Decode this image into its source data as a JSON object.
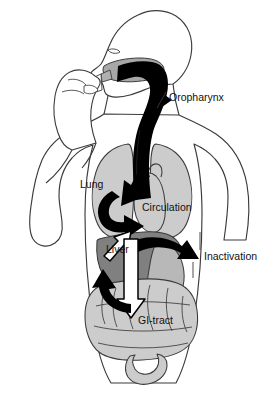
{
  "figure": {
    "background_color": "#ffffff"
  },
  "palette": {
    "outline": "#3b3b3b",
    "body_fill": "#ffffff",
    "organ_light_gray": "#cccccc",
    "organ_mid_gray": "#b8b8b8",
    "liver_gray": "#808080",
    "tongue_gray": "#a8a8a8",
    "airway_black": "#000000",
    "arrow_black": "#000000",
    "arrow_outline_white": "#ffffff",
    "label_text": "#111111"
  },
  "labels": [
    {
      "id": "oropharynx",
      "text": "Oropharynx",
      "x": 169,
      "y": 98,
      "anchor": "start",
      "leader": true
    },
    {
      "id": "lung",
      "text": "Lung",
      "x": 80,
      "y": 185,
      "anchor": "start",
      "leader": false
    },
    {
      "id": "circulation",
      "text": "Circulation",
      "x": 142,
      "y": 208,
      "anchor": "start",
      "leader": false
    },
    {
      "id": "liver",
      "text": "Liver",
      "x": 106,
      "y": 250,
      "anchor": "start",
      "leader": false
    },
    {
      "id": "inactivation",
      "text": "Inactivation",
      "x": 204,
      "y": 257,
      "anchor": "start",
      "leader": true
    },
    {
      "id": "gi-tract",
      "text": "GI-tract",
      "x": 138,
      "y": 321,
      "anchor": "start",
      "leader": false
    }
  ],
  "organs": [
    {
      "id": "head",
      "name": "head-profile",
      "fill": "#ffffff"
    },
    {
      "id": "tongue",
      "name": "tongue",
      "fill": "#a8a8a8"
    },
    {
      "id": "inhaler",
      "name": "metered-dose-inhaler",
      "fill": "#ffffff"
    },
    {
      "id": "hand",
      "name": "hand-holding-inhaler",
      "fill": "#ffffff"
    },
    {
      "id": "airway",
      "name": "oropharynx-trachea-airway",
      "fill": "#000000"
    },
    {
      "id": "lung-left",
      "name": "lung-left",
      "fill": "#cccccc"
    },
    {
      "id": "lung-right",
      "name": "lung-right",
      "fill": "#cccccc"
    },
    {
      "id": "heart",
      "name": "heart",
      "fill": "#cccccc"
    },
    {
      "id": "liver",
      "name": "liver",
      "fill": "#808080"
    },
    {
      "id": "stomach",
      "name": "stomach",
      "fill": "#b8b8b8"
    },
    {
      "id": "intestines",
      "name": "intestines",
      "fill": "#cccccc"
    },
    {
      "id": "colon",
      "name": "colon-rectum",
      "fill": "#cccccc"
    }
  ],
  "flow_arrows": [
    {
      "id": "arrow-oropharynx",
      "name": "arrow-to-oropharynx",
      "style": "solid-black",
      "from": "airway",
      "to": "oropharynx"
    },
    {
      "id": "arrow-to-lung",
      "name": "arrow-airway-to-lung",
      "style": "solid-black",
      "from": "airway",
      "to": "lung"
    },
    {
      "id": "arrow-lung-to-circulation",
      "name": "arrow-lung-to-circulation",
      "style": "solid-black-curved",
      "from": "lung",
      "to": "circulation"
    },
    {
      "id": "arrow-liver-to-circulation",
      "name": "arrow-liver-to-circulation",
      "style": "outlined-white",
      "from": "liver",
      "to": "circulation"
    },
    {
      "id": "arrow-liver-to-inactivation",
      "name": "arrow-liver-to-inactivation",
      "style": "solid-black-curved",
      "from": "liver",
      "to": "inactivation"
    },
    {
      "id": "arrow-circulation-to-gi",
      "name": "arrow-circulation-to-gi-tract",
      "style": "outlined-white",
      "from": "circulation",
      "to": "gi-tract"
    },
    {
      "id": "arrow-gi-to-liver",
      "name": "arrow-gi-tract-to-liver",
      "style": "solid-black-curved",
      "from": "gi-tract",
      "to": "liver"
    }
  ]
}
